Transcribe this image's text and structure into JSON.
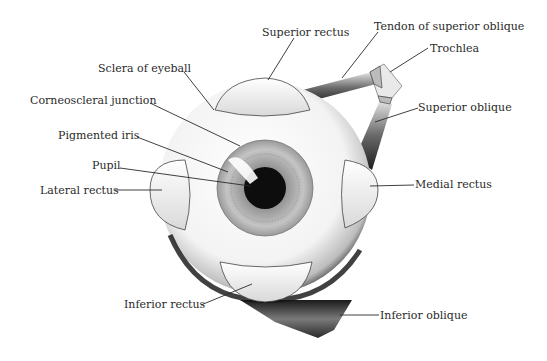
{
  "diagram": {
    "labels": {
      "superior_rectus": "Superior rectus",
      "tendon_superior_oblique": "Tendon of superior oblique",
      "trochlea": "Trochlea",
      "superior_oblique": "Superior oblique",
      "medial_rectus": "Medial rectus",
      "inferior_oblique": "Inferior oblique",
      "sclera": "Sclera of eyeball",
      "corneoscleral_junction": "Corneoscleral junction",
      "pigmented_iris": "Pigmented iris",
      "pupil": "Pupil",
      "lateral_rectus": "Lateral rectus",
      "inferior_rectus": "Inferior rectus"
    },
    "colors": {
      "background": "#ffffff",
      "ink": "#2a2a2a",
      "sclera": "#f7f7f7",
      "shadow": "#1a1a1a",
      "iris": "#b8b8b8",
      "pupil": "#0d0d0d"
    }
  }
}
